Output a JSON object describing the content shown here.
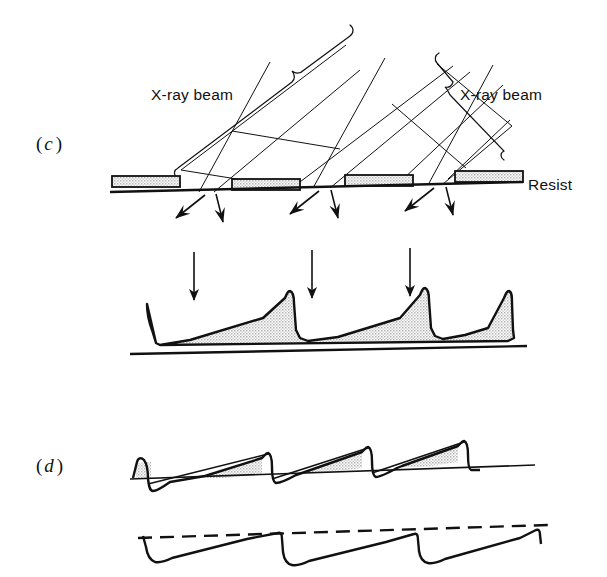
{
  "figure": {
    "background_color": "#ffffff",
    "ink_color": "#111111",
    "stipple_color": "#c8c8c8",
    "width": 607,
    "height": 577
  },
  "panels": [
    {
      "id": "c",
      "label_paren_open": "(",
      "label_letter": "c",
      "label_paren_close": ")",
      "label_x": 36,
      "label_y": 150
    },
    {
      "id": "d",
      "label_paren_open": "(",
      "label_letter": "d",
      "label_paren_close": ")",
      "label_x": 36,
      "label_y": 465
    }
  ],
  "labels": [
    {
      "name": "xray-beam-left",
      "text": "X-ray beam",
      "x": 151,
      "y": 100,
      "anchor": "start"
    },
    {
      "name": "xray-beam-right",
      "text": "X-ray beam",
      "x": 460,
      "y": 100,
      "anchor": "start"
    },
    {
      "name": "resist",
      "text": "Resist",
      "x": 528,
      "y": 190,
      "anchor": "start"
    }
  ],
  "mask_bars": [
    {
      "x": 112,
      "y": 176,
      "w": 68,
      "h": 11
    },
    {
      "x": 232,
      "y": 180,
      "w": 68,
      "h": 11
    },
    {
      "x": 345,
      "y": 176,
      "w": 68,
      "h": 11
    },
    {
      "x": 455,
      "y": 172,
      "w": 68,
      "h": 11
    }
  ],
  "substrate_line_c": {
    "x1": 112,
    "y1": 192,
    "x2": 520,
    "y2": 180
  },
  "beam_rays": [
    {
      "x1": 181,
      "y1": 170,
      "x2": 342,
      "y2": 48
    },
    {
      "x1": 283,
      "y1": 186,
      "x2": 446,
      "y2": 63
    },
    {
      "x1": 297,
      "y1": 188,
      "x2": 445,
      "y2": 70
    },
    {
      "x1": 400,
      "y1": 182,
      "x2": 500,
      "y2": 88
    },
    {
      "x1": 271,
      "y1": 180,
      "x2": 196,
      "y2": 66
    },
    {
      "x1": 322,
      "y1": 182,
      "x2": 282,
      "y2": 55
    },
    {
      "x1": 429,
      "y1": 178,
      "x2": 392,
      "y2": 52
    },
    {
      "x1": 455,
      "y1": 177,
      "x2": 410,
      "y2": 56
    }
  ],
  "exposure_arrows_c": [
    {
      "name": "slanted-arrow-1",
      "x1": 196,
      "y1": 193,
      "x2": 172,
      "y2": 219
    },
    {
      "name": "vertical-arrow-1",
      "x1": 213,
      "y1": 192,
      "x2": 221,
      "y2": 227
    },
    {
      "name": "slanted-arrow-2",
      "x1": 311,
      "y1": 190,
      "x2": 287,
      "y2": 216
    },
    {
      "name": "vertical-arrow-2",
      "x1": 327,
      "y1": 188,
      "x2": 335,
      "y2": 224
    },
    {
      "name": "slanted-arrow-3",
      "x1": 426,
      "y1": 186,
      "x2": 402,
      "y2": 212
    },
    {
      "name": "vertical-arrow-3",
      "x1": 441,
      "y1": 184,
      "x2": 449,
      "y2": 221
    }
  ],
  "development_arrows": [
    {
      "name": "dev-arrow-1",
      "x1": 194,
      "y1": 252,
      "x2": 194,
      "y2": 302
    },
    {
      "name": "dev-arrow-2",
      "x1": 312,
      "y1": 250,
      "x2": 312,
      "y2": 300
    },
    {
      "name": "dev-arrow-3",
      "x1": 410,
      "y1": 248,
      "x2": 410,
      "y2": 298
    }
  ],
  "sawtooth_c": {
    "name": "resist-sawtooth-profile",
    "baseline_left_y": 345,
    "baseline_right_y": 336,
    "x_start": 145,
    "x_end": 508,
    "teeth": 3,
    "peak_height": 58
  },
  "substrate_line_sawtooth": {
    "x1": 132,
    "y1": 353,
    "x2": 525,
    "y2": 345
  },
  "thin_profile_d": {
    "name": "thin-resist-sawtooth",
    "x_start": 132,
    "x_end": 530,
    "baseline_left_y": 478,
    "baseline_right_y": 464,
    "teeth": 3,
    "peak_height": 26
  },
  "dashed_profile_d": {
    "name": "dashed-reference-sawtooth",
    "x_start": 140,
    "x_end": 545,
    "dash_left_y": 537,
    "dash_right_y": 525,
    "teeth": 3,
    "drop_depth": 24
  }
}
